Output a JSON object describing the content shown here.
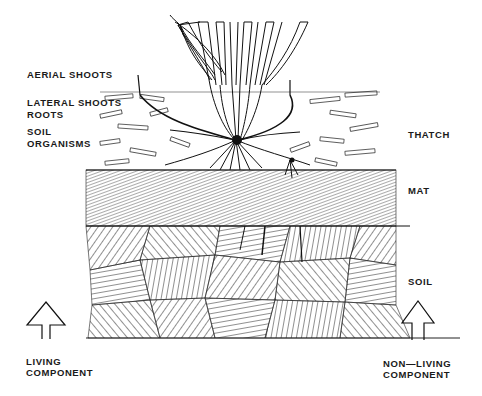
{
  "left_labels": {
    "aerial_shoots": "AERIAL SHOOTS",
    "lateral_shoots": "LATERAL SHOOTS",
    "roots": "ROOTS",
    "soil_organisms_1": "SOIL",
    "soil_organisms_2": "ORGANISMS"
  },
  "right_labels": {
    "thatch": "THATCH",
    "mat": "MAT",
    "soil": "SOIL"
  },
  "bottom_labels": {
    "living_1": "LIVING",
    "living_2": "COMPONENT",
    "nonliving_1": "NON—LIVING",
    "nonliving_2": "COMPONENT"
  },
  "icons": {
    "living_arrow": "up-arrow-outline",
    "nonliving_arrow": "up-arrow-outline"
  },
  "colors": {
    "ink": "#1a1a1a",
    "background": "#ffffff"
  }
}
